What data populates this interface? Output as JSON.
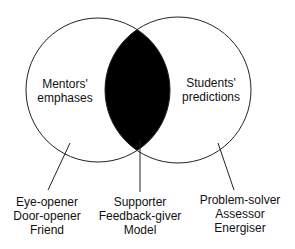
{
  "diagram": {
    "type": "venn",
    "sets": [
      {
        "name": "left",
        "label_lines": [
          "Mentors'",
          "emphases"
        ]
      },
      {
        "name": "right",
        "label_lines": [
          "Students'",
          "predictions"
        ]
      }
    ],
    "intersection_fill": "#000000",
    "callouts": [
      {
        "target": "mentors-only",
        "lines": [
          "Eye-opener",
          "Door-opener",
          "Friend"
        ]
      },
      {
        "target": "intersection",
        "lines": [
          "Supporter",
          "Feedback-giver",
          "Model"
        ]
      },
      {
        "target": "students-only",
        "lines": [
          "Problem-solver",
          "Assessor",
          "Energiser"
        ]
      }
    ]
  }
}
